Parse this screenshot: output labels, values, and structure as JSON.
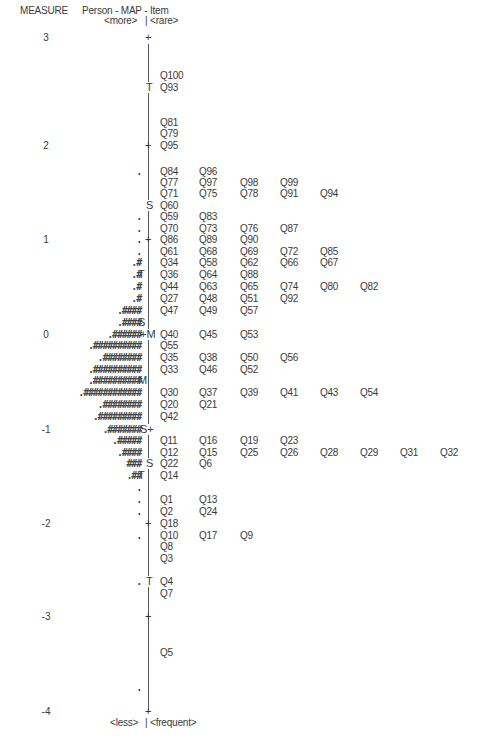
{
  "header": {
    "measure": "MEASURE",
    "title": "Person - MAP - Item",
    "top_left": "<more>",
    "top_right": "<rare>",
    "bottom_left": "<less>",
    "bottom_right": "<frequent>",
    "separator": "|"
  },
  "axis": {
    "ticks": [
      {
        "label": "3",
        "y": 38
      },
      {
        "label": "2",
        "y": 146
      },
      {
        "label": "1",
        "y": 240
      },
      {
        "label": "0",
        "y": 335
      },
      {
        "label": "-1",
        "y": 430
      },
      {
        "label": "-2",
        "y": 524
      },
      {
        "label": "-3",
        "y": 617
      },
      {
        "label": "-4",
        "y": 712
      }
    ]
  },
  "markers": [
    {
      "text": "T",
      "side": "item",
      "y": 88
    },
    {
      "text": "S",
      "side": "item",
      "y": 206
    },
    {
      "text": "T",
      "side": "person",
      "y": 275
    },
    {
      "text": "S",
      "side": "person",
      "y": 323
    },
    {
      "text": "+M",
      "side": "center",
      "y": 335
    },
    {
      "text": "M",
      "side": "person",
      "y": 381
    },
    {
      "text": "S+",
      "side": "center",
      "y": 430
    },
    {
      "text": "S",
      "side": "item",
      "y": 464
    },
    {
      "text": "T",
      "side": "person",
      "y": 476
    },
    {
      "text": "T",
      "side": "item",
      "y": 582
    }
  ],
  "plus_ticks": [
    38,
    146,
    240,
    430,
    524,
    617,
    712
  ],
  "persons": [
    {
      "y": 172,
      "text": "."
    },
    {
      "y": 217,
      "text": "."
    },
    {
      "y": 229,
      "text": "."
    },
    {
      "y": 240,
      "text": "."
    },
    {
      "y": 252,
      "text": "."
    },
    {
      "y": 263,
      "text": ".#"
    },
    {
      "y": 275,
      "text": ".#"
    },
    {
      "y": 287,
      "text": ".#"
    },
    {
      "y": 299,
      "text": ".#"
    },
    {
      "y": 311,
      "text": ".####"
    },
    {
      "y": 323,
      "text": ".####"
    },
    {
      "y": 335,
      "text": ".######"
    },
    {
      "y": 346,
      "text": ".##########"
    },
    {
      "y": 358,
      "text": ".########"
    },
    {
      "y": 370,
      "text": ".##########"
    },
    {
      "y": 381,
      "text": ".##########"
    },
    {
      "y": 393,
      "text": ".############"
    },
    {
      "y": 405,
      "text": ".########"
    },
    {
      "y": 417,
      "text": ".#########"
    },
    {
      "y": 430,
      "text": ".#######"
    },
    {
      "y": 441,
      "text": ".#####"
    },
    {
      "y": 453,
      "text": ".####"
    },
    {
      "y": 464,
      "text": "###"
    },
    {
      "y": 476,
      "text": ".##"
    },
    {
      "y": 488,
      "text": "."
    },
    {
      "y": 500,
      "text": "."
    },
    {
      "y": 512,
      "text": "."
    },
    {
      "y": 536,
      "text": "."
    },
    {
      "y": 582,
      "text": "."
    },
    {
      "y": 688,
      "text": "."
    }
  ],
  "items": [
    {
      "y": 76,
      "codes": [
        "Q100"
      ]
    },
    {
      "y": 88,
      "codes": [
        "Q93"
      ]
    },
    {
      "y": 123,
      "codes": [
        "Q81"
      ]
    },
    {
      "y": 134,
      "codes": [
        "Q79"
      ]
    },
    {
      "y": 146,
      "codes": [
        "Q95"
      ]
    },
    {
      "y": 172,
      "codes": [
        "Q84",
        "Q96"
      ]
    },
    {
      "y": 183,
      "codes": [
        "Q77",
        "Q97",
        "Q98",
        "Q99"
      ]
    },
    {
      "y": 194,
      "codes": [
        "Q71",
        "Q75",
        "Q78",
        "Q91",
        "Q94"
      ]
    },
    {
      "y": 206,
      "codes": [
        "Q60"
      ]
    },
    {
      "y": 217,
      "codes": [
        "Q59",
        "Q83"
      ]
    },
    {
      "y": 229,
      "codes": [
        "Q70",
        "Q73",
        "Q76",
        "Q87"
      ]
    },
    {
      "y": 240,
      "codes": [
        "Q86",
        "Q89",
        "Q90"
      ]
    },
    {
      "y": 252,
      "codes": [
        "Q61",
        "Q68",
        "Q69",
        "Q72",
        "Q85"
      ]
    },
    {
      "y": 263,
      "codes": [
        "Q34",
        "Q58",
        "Q62",
        "Q66",
        "Q67"
      ]
    },
    {
      "y": 275,
      "codes": [
        "Q36",
        "Q64",
        "Q88"
      ]
    },
    {
      "y": 287,
      "codes": [
        "Q44",
        "Q63",
        "Q65",
        "Q74",
        "Q80",
        "Q82"
      ]
    },
    {
      "y": 299,
      "codes": [
        "Q27",
        "Q48",
        "Q51",
        "Q92"
      ]
    },
    {
      "y": 311,
      "codes": [
        "Q47",
        "Q49",
        "Q57"
      ]
    },
    {
      "y": 335,
      "codes": [
        "Q40",
        "Q45",
        "Q53"
      ]
    },
    {
      "y": 346,
      "codes": [
        "Q55"
      ]
    },
    {
      "y": 358,
      "codes": [
        "Q35",
        "Q38",
        "Q50",
        "Q56"
      ]
    },
    {
      "y": 370,
      "codes": [
        "Q33",
        "Q46",
        "Q52"
      ]
    },
    {
      "y": 393,
      "codes": [
        "Q30",
        "Q37",
        "Q39",
        "Q41",
        "Q43",
        "Q54"
      ]
    },
    {
      "y": 405,
      "codes": [
        "Q20",
        "Q21"
      ]
    },
    {
      "y": 417,
      "codes": [
        "Q42"
      ]
    },
    {
      "y": 441,
      "codes": [
        "Q11",
        "Q16",
        "Q19",
        "Q23"
      ]
    },
    {
      "y": 453,
      "codes": [
        "Q12",
        "Q15",
        "Q25",
        "Q26",
        "Q28",
        "Q29",
        "Q31",
        "Q32"
      ]
    },
    {
      "y": 464,
      "codes": [
        "Q22",
        "Q6"
      ]
    },
    {
      "y": 476,
      "codes": [
        "Q14"
      ]
    },
    {
      "y": 500,
      "codes": [
        "Q1",
        "Q13"
      ]
    },
    {
      "y": 512,
      "codes": [
        "Q2",
        "Q24"
      ]
    },
    {
      "y": 524,
      "codes": [
        "Q18"
      ]
    },
    {
      "y": 536,
      "codes": [
        "Q10",
        "Q17",
        "Q9"
      ]
    },
    {
      "y": 547,
      "codes": [
        "Q8"
      ]
    },
    {
      "y": 559,
      "codes": [
        "Q3"
      ]
    },
    {
      "y": 582,
      "codes": [
        "Q4"
      ]
    },
    {
      "y": 594,
      "codes": [
        "Q7"
      ]
    },
    {
      "y": 653,
      "codes": [
        "Q5"
      ]
    }
  ],
  "chart_data": {
    "type": "scatter",
    "title": "Person - MAP - Item",
    "ylabel": "MEASURE",
    "ylim": [
      -4,
      3
    ],
    "y_ticks": [
      3,
      2,
      1,
      0,
      -1,
      -2,
      -3,
      -4
    ],
    "left_label_top": "<more>",
    "right_label_top": "<rare>",
    "left_label_bottom": "<less>",
    "right_label_bottom": "<frequent>",
    "markers": {
      "person_mean": 0.0,
      "person_S_upper": 0.12,
      "person_S_lower": -1.0,
      "person_T_upper": 0.62,
      "person_T_lower": -1.5,
      "item_mean": 0.0,
      "item_S_upper": 1.4,
      "item_S_lower": -1.37,
      "item_T_upper": 2.6,
      "item_T_lower": -2.6
    },
    "persons_note": "Each '#' and '.' represents persons; counts per row as shown",
    "person_rows": [
      {
        "measure": 1.4,
        "symbols": "."
      },
      {
        "measure": 1.12,
        "symbols": "."
      },
      {
        "measure": 1.0,
        "symbols": "."
      },
      {
        "measure": 0.88,
        "symbols": "."
      },
      {
        "measure": 0.75,
        "symbols": ".#"
      },
      {
        "measure": 0.63,
        "symbols": ".#"
      },
      {
        "measure": 0.5,
        "symbols": ".#"
      },
      {
        "measure": 0.38,
        "symbols": ".#"
      },
      {
        "measure": 0.25,
        "symbols": ".####"
      },
      {
        "measure": 0.12,
        "symbols": ".####"
      },
      {
        "measure": 0.0,
        "symbols": ".######"
      },
      {
        "measure": -0.12,
        "symbols": ".##########"
      },
      {
        "measure": -0.25,
        "symbols": ".########"
      },
      {
        "measure": -0.37,
        "symbols": ".##########"
      },
      {
        "measure": -0.5,
        "symbols": ".##########"
      },
      {
        "measure": -0.62,
        "symbols": ".############"
      },
      {
        "measure": -0.75,
        "symbols": ".########"
      },
      {
        "measure": -0.88,
        "symbols": ".#########"
      },
      {
        "measure": -1.0,
        "symbols": ".#######"
      },
      {
        "measure": -1.12,
        "symbols": ".#####"
      },
      {
        "measure": -1.25,
        "symbols": ".####"
      },
      {
        "measure": -1.37,
        "symbols": "###"
      },
      {
        "measure": -1.5,
        "symbols": ".##"
      },
      {
        "measure": -1.62,
        "symbols": "."
      },
      {
        "measure": -1.75,
        "symbols": "."
      },
      {
        "measure": -1.87,
        "symbols": "."
      },
      {
        "measure": -2.12,
        "symbols": "."
      },
      {
        "measure": -2.6,
        "symbols": "."
      },
      {
        "measure": -3.75,
        "symbols": "."
      }
    ],
    "item_rows": [
      {
        "measure": 2.6,
        "items": [
          "Q100"
        ]
      },
      {
        "measure": 2.47,
        "items": [
          "Q93"
        ]
      },
      {
        "measure": 2.25,
        "items": [
          "Q81"
        ]
      },
      {
        "measure": 2.12,
        "items": [
          "Q79"
        ]
      },
      {
        "measure": 2.0,
        "items": [
          "Q95"
        ]
      },
      {
        "measure": 1.73,
        "items": [
          "Q84",
          "Q96"
        ]
      },
      {
        "measure": 1.61,
        "items": [
          "Q77",
          "Q97",
          "Q98",
          "Q99"
        ]
      },
      {
        "measure": 1.5,
        "items": [
          "Q71",
          "Q75",
          "Q78",
          "Q91",
          "Q94"
        ]
      },
      {
        "measure": 1.37,
        "items": [
          "Q60"
        ]
      },
      {
        "measure": 1.25,
        "items": [
          "Q59",
          "Q83"
        ]
      },
      {
        "measure": 1.12,
        "items": [
          "Q70",
          "Q73",
          "Q76",
          "Q87"
        ]
      },
      {
        "measure": 1.0,
        "items": [
          "Q86",
          "Q89",
          "Q90"
        ]
      },
      {
        "measure": 0.88,
        "items": [
          "Q61",
          "Q68",
          "Q69",
          "Q72",
          "Q85"
        ]
      },
      {
        "measure": 0.75,
        "items": [
          "Q34",
          "Q58",
          "Q62",
          "Q66",
          "Q67"
        ]
      },
      {
        "measure": 0.63,
        "items": [
          "Q36",
          "Q64",
          "Q88"
        ]
      },
      {
        "measure": 0.5,
        "items": [
          "Q44",
          "Q63",
          "Q65",
          "Q74",
          "Q80",
          "Q82"
        ]
      },
      {
        "measure": 0.38,
        "items": [
          "Q27",
          "Q48",
          "Q51",
          "Q92"
        ]
      },
      {
        "measure": 0.25,
        "items": [
          "Q47",
          "Q49",
          "Q57"
        ]
      },
      {
        "measure": 0.0,
        "items": [
          "Q40",
          "Q45",
          "Q53"
        ]
      },
      {
        "measure": -0.12,
        "items": [
          "Q55"
        ]
      },
      {
        "measure": -0.25,
        "items": [
          "Q35",
          "Q38",
          "Q50",
          "Q56"
        ]
      },
      {
        "measure": -0.37,
        "items": [
          "Q33",
          "Q46",
          "Q52"
        ]
      },
      {
        "measure": -0.62,
        "items": [
          "Q30",
          "Q37",
          "Q39",
          "Q41",
          "Q43",
          "Q54"
        ]
      },
      {
        "measure": -0.75,
        "items": [
          "Q20",
          "Q21"
        ]
      },
      {
        "measure": -0.88,
        "items": [
          "Q42"
        ]
      },
      {
        "measure": -1.12,
        "items": [
          "Q11",
          "Q16",
          "Q19",
          "Q23"
        ]
      },
      {
        "measure": -1.25,
        "items": [
          "Q12",
          "Q15",
          "Q25",
          "Q26",
          "Q28",
          "Q29",
          "Q31",
          "Q32"
        ]
      },
      {
        "measure": -1.37,
        "items": [
          "Q22",
          "Q6"
        ]
      },
      {
        "measure": -1.5,
        "items": [
          "Q14"
        ]
      },
      {
        "measure": -1.75,
        "items": [
          "Q1",
          "Q13"
        ]
      },
      {
        "measure": -1.87,
        "items": [
          "Q2",
          "Q24"
        ]
      },
      {
        "measure": -2.0,
        "items": [
          "Q18"
        ]
      },
      {
        "measure": -2.12,
        "items": [
          "Q10",
          "Q17",
          "Q9"
        ]
      },
      {
        "measure": -2.25,
        "items": [
          "Q8"
        ]
      },
      {
        "measure": -2.37,
        "items": [
          "Q3"
        ]
      },
      {
        "measure": -2.6,
        "items": [
          "Q4"
        ]
      },
      {
        "measure": -2.73,
        "items": [
          "Q7"
        ]
      },
      {
        "measure": -3.37,
        "items": [
          "Q5"
        ]
      }
    ]
  }
}
